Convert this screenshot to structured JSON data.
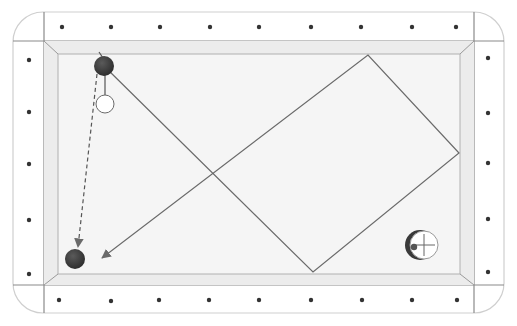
{
  "diagram": {
    "type": "billiards-shot-diagram",
    "colors": {
      "background": "#ffffff",
      "rail": "#ffffff",
      "rail_outline": "#c8c8c8",
      "frame_line": "#8a8a8a",
      "cushion": "#ebebeb",
      "cloth": "#f4f4f4",
      "diamond": "#333333",
      "path": "#6a6a6a",
      "ball_dark": "#3e3e3e",
      "ball_white": "#ffffff"
    },
    "table": {
      "outer": {
        "x": 13,
        "y": 12,
        "w": 491,
        "h": 301,
        "radius": 30
      },
      "frame": {
        "x": 44,
        "y": 41,
        "w": 430,
        "h": 244
      },
      "cloth": {
        "x": 58,
        "y": 54,
        "w": 402,
        "h": 220
      }
    },
    "diamonds": {
      "top": [
        [
          62,
          27
        ],
        [
          111,
          27
        ],
        [
          160,
          27
        ],
        [
          210,
          27
        ],
        [
          259,
          27
        ],
        [
          311,
          27
        ],
        [
          361,
          27
        ],
        [
          412,
          27
        ],
        [
          456,
          27
        ]
      ],
      "bottom": [
        [
          59,
          300
        ],
        [
          111,
          301
        ],
        [
          159,
          300
        ],
        [
          209,
          300
        ],
        [
          259,
          300
        ],
        [
          311,
          300
        ],
        [
          362,
          300
        ],
        [
          412,
          300
        ],
        [
          457,
          300
        ]
      ],
      "left": [
        [
          29,
          60
        ],
        [
          29,
          112
        ],
        [
          29,
          164
        ],
        [
          29,
          220
        ],
        [
          29,
          274
        ]
      ],
      "right": [
        [
          488,
          58
        ],
        [
          488,
          113
        ],
        [
          488,
          163
        ],
        [
          488,
          219
        ],
        [
          488,
          272
        ]
      ]
    },
    "balls": [
      {
        "name": "object-ball-start",
        "x": 104,
        "y": 66,
        "r": 10,
        "color": "dark"
      },
      {
        "name": "cue-ball",
        "x": 105,
        "y": 104,
        "r": 9,
        "color": "white"
      },
      {
        "name": "object-ball-target",
        "x": 75,
        "y": 259,
        "r": 10,
        "color": "dark"
      }
    ],
    "cue_path": {
      "points": [
        [
          104,
          66
        ],
        [
          313,
          272
        ],
        [
          459,
          153
        ],
        [
          368,
          55
        ],
        [
          102,
          258
        ]
      ],
      "arrow": true,
      "crossing_point": [
        208,
        174
      ]
    },
    "object_ball_path": {
      "from": [
        97,
        74
      ],
      "to": [
        78,
        247
      ],
      "dashed": true,
      "arrow": true
    },
    "aim_line": {
      "from": [
        99,
        52
      ],
      "to": [
        103,
        58
      ]
    },
    "contact_line": {
      "from": [
        105,
        72
      ],
      "to": [
        105,
        95
      ]
    },
    "spin_indicator": {
      "x": 423,
      "y": 245,
      "r": 14,
      "dot": [
        414,
        247
      ],
      "label": "left english"
    },
    "cropped_header_text": ""
  }
}
